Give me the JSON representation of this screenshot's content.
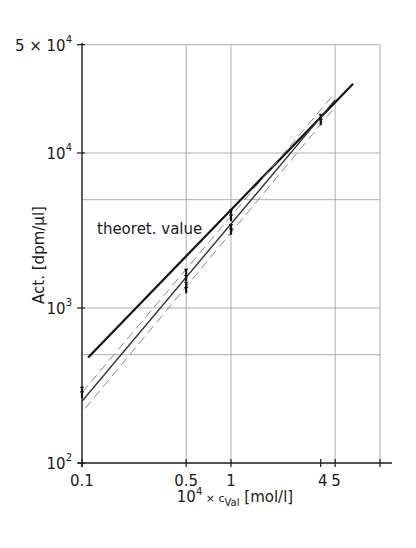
{
  "chart_data": {
    "type": "line",
    "title": "",
    "xlabel": "10^4 × c_Val [mol/l]",
    "xlabel_parts": {
      "base": "10",
      "exp": "4",
      "times": " × c",
      "sub": "Val",
      "unit": " [mol/l]"
    },
    "ylabel": "Act. [dpm/µl]",
    "xscale": "log",
    "yscale": "log",
    "xlim": [
      0.1,
      10
    ],
    "ylim": [
      100,
      50000
    ],
    "grid": true,
    "x_ticks": [
      {
        "value": 0.1,
        "label": "0.1"
      },
      {
        "value": 0.5,
        "label": "0.5"
      },
      {
        "value": 1,
        "label": "1"
      },
      {
        "value": 4,
        "label": "4"
      },
      {
        "value": 5,
        "label": "5"
      },
      {
        "value": 10,
        "label": ""
      }
    ],
    "x_gridlines": [
      0.5,
      1,
      5,
      10
    ],
    "y_ticks": [
      {
        "value": 100,
        "base": "10",
        "exp": "2",
        "prefix": ""
      },
      {
        "value": 1000,
        "base": "10",
        "exp": "3",
        "prefix": ""
      },
      {
        "value": 10000,
        "base": "10",
        "exp": "4",
        "prefix": ""
      },
      {
        "value": 50000,
        "base": "10",
        "exp": "4",
        "prefix": "5 × "
      }
    ],
    "y_gridlines": [
      500,
      1000,
      5000,
      10000,
      50000
    ],
    "series": [
      {
        "name": "theoret. value",
        "style": "solid-thick",
        "x": [
          0.11,
          6.6
        ],
        "y": [
          480,
          28000
        ]
      },
      {
        "name": "regression",
        "style": "solid",
        "x": [
          0.1,
          5.0
        ],
        "y": [
          250,
          22000
        ]
      },
      {
        "name": "upper confidence",
        "style": "dashed",
        "x": [
          0.1,
          5.0
        ],
        "y": [
          285,
          24500
        ]
      },
      {
        "name": "lower confidence",
        "style": "dashed",
        "x": [
          0.105,
          5.0
        ],
        "y": [
          225,
          19800
        ]
      },
      {
        "name": "measured",
        "style": "points",
        "x": [
          0.1,
          0.1,
          0.5,
          0.5,
          0.5,
          0.5,
          1,
          1,
          1,
          1,
          4,
          4
        ],
        "y": [
          275,
          295,
          1300,
          1400,
          1550,
          1700,
          3100,
          3300,
          3800,
          4100,
          15800,
          17000
        ]
      }
    ],
    "annotations": [
      {
        "text": "theoret. value",
        "x": 0.13,
        "y": 4300
      }
    ]
  }
}
